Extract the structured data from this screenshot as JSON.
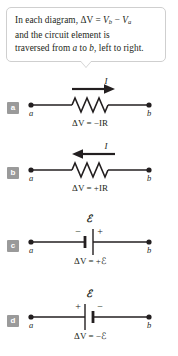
{
  "callout": {
    "line1_prefix": "In each diagram, ",
    "delta_v": "ΔV",
    "equals": " = ",
    "vb": "V",
    "vb_sub": "b",
    "minus": " − ",
    "va": "V",
    "va_sub": "a",
    "line2": "and the circuit element is",
    "line3_prefix": "traversed from ",
    "line3_a": "a",
    "line3_mid": " to ",
    "line3_b": "b",
    "line3_suffix": ", left to right."
  },
  "diagrams": [
    {
      "badge": "a",
      "element": "resistor",
      "node_left": "a",
      "node_right": "b",
      "current_label": "I",
      "current_direction": "right",
      "equation_lhs": "ΔV",
      "equation_eq": " = ",
      "equation_sign": "−",
      "equation_rhs": "IR",
      "equation_full": "ΔV = −IR"
    },
    {
      "badge": "b",
      "element": "resistor",
      "node_left": "a",
      "node_right": "b",
      "current_label": "I",
      "current_direction": "left",
      "equation_lhs": "ΔV",
      "equation_eq": " = ",
      "equation_sign": "+",
      "equation_rhs": "IR",
      "equation_full": "ΔV = +IR"
    },
    {
      "badge": "c",
      "element": "battery",
      "node_left": "a",
      "node_right": "b",
      "emf_label": "ℰ",
      "terminal_left": "−",
      "terminal_right": "+",
      "equation_lhs": "ΔV",
      "equation_eq": " = ",
      "equation_sign": "+",
      "equation_rhs": "ℰ",
      "equation_full": "ΔV = +ℰ"
    },
    {
      "badge": "d",
      "element": "battery",
      "node_left": "a",
      "node_right": "b",
      "emf_label": "ℰ",
      "terminal_left": "+",
      "terminal_right": "−",
      "equation_lhs": "ΔV",
      "equation_eq": " = ",
      "equation_sign": "−",
      "equation_rhs": "ℰ",
      "equation_full": "ΔV = −ℰ"
    }
  ],
  "colors": {
    "ink": "#231f20",
    "badge_bg": "#9a9a9a",
    "callout_border": "#cfcfcf",
    "page_bg": "#ffffff"
  }
}
